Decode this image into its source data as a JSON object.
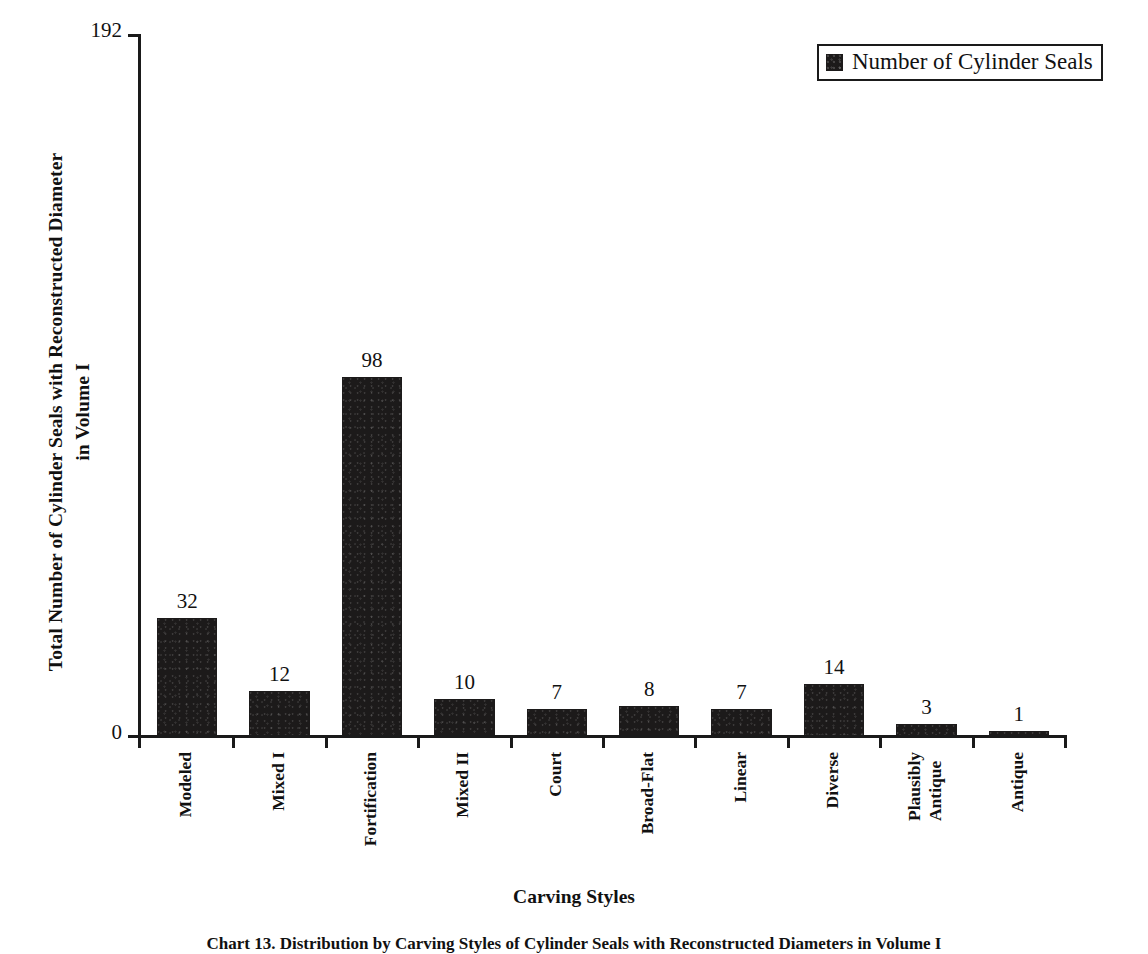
{
  "figure": {
    "caption": "Chart 13. Distribution by Carving Styles of Cylinder Seals with Reconstructed Diameters in Volume I"
  },
  "legend": {
    "position": "top-right",
    "swatch_icon": "filled-square-icon",
    "label": "Number of Cylinder Seals",
    "swatch_color": "#1c1a1a"
  },
  "axes": {
    "y_title_line1": "Total Number of Cylinder Seals with Reconstructed Diameter",
    "y_title_line2": "in Volume I",
    "y_tick_max": "192",
    "y_tick_zero": "0",
    "x_title": "Carving Styles"
  },
  "chart_data": {
    "type": "bar",
    "title": "",
    "xlabel": "Carving Styles",
    "ylabel": "Total Number of Cylinder Seals with Reconstructed Diameter in Volume I",
    "ylim": [
      0,
      192
    ],
    "yticks": [
      0,
      192
    ],
    "grid": false,
    "legend_position": "top-right",
    "bar_color": "#1c1a1a",
    "categories": [
      "Modeled",
      "Mixed I",
      "Fortification",
      "Mixed II",
      "Court",
      "Broad-Flat",
      "Linear",
      "Diverse",
      "Plausibly Antique",
      "Antique"
    ],
    "category_label_lines": [
      [
        "Modeled"
      ],
      [
        "Mixed I"
      ],
      [
        "Fortification"
      ],
      [
        "Mixed II"
      ],
      [
        "Court"
      ],
      [
        "Broad-Flat"
      ],
      [
        "Linear"
      ],
      [
        "Diverse"
      ],
      [
        "Plausibly",
        "Antique"
      ],
      [
        "Antique"
      ]
    ],
    "series": [
      {
        "name": "Number of Cylinder Seals",
        "values": [
          32,
          12,
          98,
          10,
          7,
          8,
          7,
          14,
          3,
          1
        ]
      }
    ],
    "values": [
      32,
      12,
      98,
      10,
      7,
      8,
      7,
      14,
      3,
      1
    ],
    "data_labels": [
      "32",
      "12",
      "98",
      "10",
      "7",
      "8",
      "7",
      "14",
      "3",
      "1"
    ]
  }
}
